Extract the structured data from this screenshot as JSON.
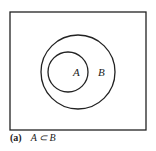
{
  "diagram": {
    "type": "venn",
    "universe": {
      "x": 10,
      "y": 12,
      "width": 136,
      "height": 118
    },
    "sets": [
      {
        "label": "A",
        "cx": 68,
        "cy": 72,
        "r": 20,
        "label_x": 75,
        "label_y": 76
      },
      {
        "label": "B",
        "cx": 78,
        "cy": 72,
        "r": 37,
        "label_x": 100,
        "label_y": 76
      }
    ],
    "stroke_color": "#222222"
  },
  "caption": {
    "label": "(a)",
    "relation": "A ⊂ B"
  }
}
